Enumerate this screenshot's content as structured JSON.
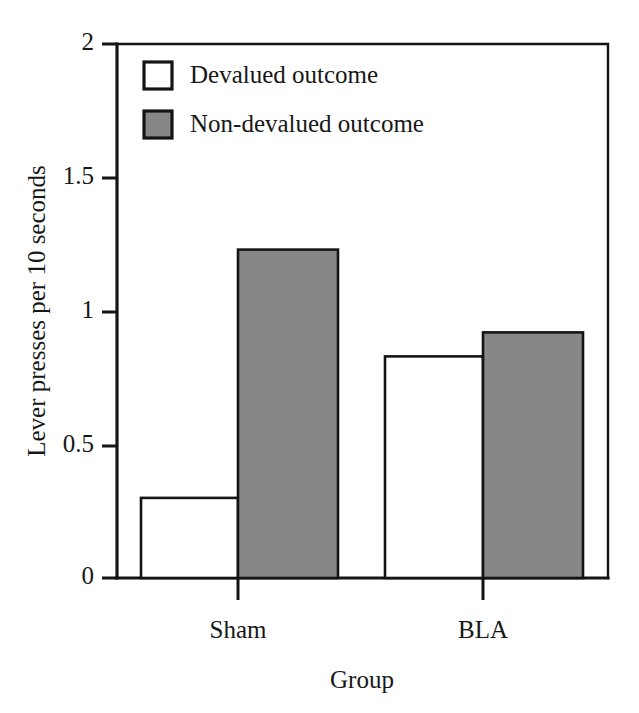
{
  "chart_data": {
    "type": "bar",
    "title": "",
    "subtitle": "",
    "xlabel": "Group",
    "ylabel": "Lever presses per 10 seconds",
    "categories": [
      "Sham",
      "BLA"
    ],
    "series": [
      {
        "name": "Devalued outcome",
        "values": [
          0.3,
          0.83
        ],
        "fill": "#ffffff"
      },
      {
        "name": "Non-devalued outcome",
        "values": [
          1.23,
          0.92
        ],
        "fill": "#878787"
      }
    ],
    "ylim": [
      0,
      2
    ],
    "yticks": [
      0,
      0.5,
      1,
      1.5,
      2
    ],
    "ytick_labels": [
      "0",
      "0.5",
      "1",
      "1.5",
      "2"
    ],
    "xtick_labels": [
      "Sham",
      "BLA"
    ],
    "grid": false,
    "legend_position": "upper-left-inside",
    "legend": [
      {
        "label": "Devalued outcome",
        "swatch": "white"
      },
      {
        "label": "Non-devalued outcome",
        "swatch": "grey"
      }
    ],
    "annotations": []
  },
  "colors": {
    "axis": "#141414",
    "bar_devalued": "#ffffff",
    "bar_non_devalued": "#878787",
    "text": "#171717",
    "background": "#ffffff"
  },
  "axis": {
    "y_tick_0": "0",
    "y_tick_1": "0.5",
    "y_tick_2": "1",
    "y_tick_3": "1.5",
    "y_tick_4": "2",
    "x_label": "Group",
    "y_label": "Lever presses per 10 seconds",
    "cat_sham": "Sham",
    "cat_bla": "BLA"
  },
  "legend": {
    "item_1_label": "Devalued outcome",
    "item_2_label": "Non-devalued outcome"
  }
}
